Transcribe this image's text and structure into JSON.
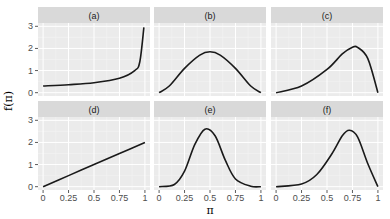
{
  "chart_data": {
    "type": "line",
    "title": "",
    "xlabel": "π",
    "ylabel": "f(π)",
    "xlim": [
      0,
      1
    ],
    "ylim": [
      0,
      3
    ],
    "x_ticks": [
      "0",
      "0.25",
      "0.5",
      "0.75",
      "1"
    ],
    "y_ticks": [
      "0",
      "1",
      "2",
      "3"
    ],
    "grid": true,
    "legend": "none",
    "layout": {
      "rows": 2,
      "cols": 3
    },
    "panels": [
      {
        "label": "(a)",
        "x": [
          0,
          0.25,
          0.5,
          0.75,
          0.9,
          0.95,
          0.99
        ],
        "y": [
          0.3,
          0.36,
          0.45,
          0.65,
          1.0,
          1.4,
          2.95
        ]
      },
      {
        "label": "(b)",
        "x": [
          0,
          0.1,
          0.25,
          0.4,
          0.5,
          0.6,
          0.75,
          0.9,
          1
        ],
        "y": [
          0,
          0.3,
          1.1,
          1.7,
          1.85,
          1.7,
          1.1,
          0.3,
          0
        ]
      },
      {
        "label": "(c)",
        "x": [
          0,
          0.25,
          0.5,
          0.65,
          0.75,
          0.8,
          0.9,
          1
        ],
        "y": [
          0,
          0.3,
          1.05,
          1.75,
          2.05,
          2.05,
          1.55,
          0
        ]
      },
      {
        "label": "(d)",
        "x": [
          0,
          0.25,
          0.5,
          0.75,
          1
        ],
        "y": [
          0,
          0.5,
          1.0,
          1.5,
          2.0
        ]
      },
      {
        "label": "(e)",
        "x": [
          0,
          0.15,
          0.25,
          0.35,
          0.45,
          0.55,
          0.65,
          0.75,
          0.9,
          1
        ],
        "y": [
          0,
          0.1,
          0.7,
          1.9,
          2.6,
          2.3,
          1.2,
          0.35,
          0.02,
          0
        ]
      },
      {
        "label": "(f)",
        "x": [
          0,
          0.25,
          0.4,
          0.55,
          0.65,
          0.72,
          0.8,
          0.9,
          1
        ],
        "y": [
          0,
          0.12,
          0.55,
          1.5,
          2.3,
          2.55,
          2.25,
          1.05,
          0
        ]
      }
    ]
  },
  "colors": {
    "panel_bg": "#ebebeb",
    "strip_bg": "#d9d9d9",
    "grid_major": "#ffffff",
    "line": "#1a1a1a"
  }
}
